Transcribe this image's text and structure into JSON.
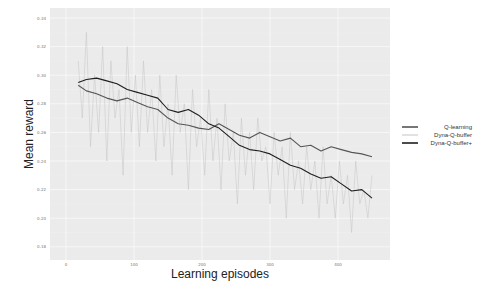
{
  "chart_data": {
    "type": "line",
    "title": "",
    "xlabel": "Learning episodes",
    "ylabel": "Mean reward",
    "xlim": [
      -5,
      475
    ],
    "ylim": [
      0.175,
      0.345
    ],
    "x_ticks": [
      0,
      100,
      200,
      300,
      400
    ],
    "x_tick_labels": [
      "0",
      "100",
      "200",
      "300",
      "400"
    ],
    "y_ticks": [
      0.18,
      0.2,
      0.22,
      0.24,
      0.26,
      0.28,
      0.3,
      0.32,
      0.34
    ],
    "y_tick_labels": [
      "0.18",
      "0.20",
      "0.22",
      "0.24",
      "0.26",
      "0.28",
      "0.30",
      "0.32",
      "0.34"
    ],
    "grid": true,
    "background": "#ebebeb",
    "legend_position": "right",
    "series": [
      {
        "name": "Q-learning",
        "color": "#555555",
        "width": 1.1,
        "x": [
          18,
          30,
          45,
          60,
          75,
          90,
          105,
          120,
          135,
          150,
          165,
          180,
          195,
          210,
          225,
          240,
          255,
          270,
          285,
          300,
          315,
          330,
          345,
          360,
          375,
          390,
          405,
          420,
          435,
          450
        ],
        "values": [
          0.293,
          0.289,
          0.287,
          0.284,
          0.282,
          0.284,
          0.281,
          0.278,
          0.276,
          0.27,
          0.266,
          0.265,
          0.263,
          0.262,
          0.266,
          0.262,
          0.258,
          0.256,
          0.26,
          0.257,
          0.254,
          0.256,
          0.25,
          0.251,
          0.247,
          0.25,
          0.248,
          0.246,
          0.245,
          0.243
        ]
      },
      {
        "name": "Dyna-Q-buffer",
        "color": "#c4c4c4",
        "width": 0.5,
        "x": [
          18,
          24,
          30,
          36,
          42,
          48,
          54,
          60,
          66,
          72,
          78,
          84,
          90,
          96,
          102,
          108,
          114,
          120,
          126,
          132,
          138,
          144,
          150,
          156,
          162,
          168,
          174,
          180,
          186,
          192,
          198,
          204,
          210,
          216,
          222,
          228,
          234,
          240,
          246,
          252,
          258,
          264,
          270,
          276,
          282,
          288,
          294,
          300,
          306,
          312,
          318,
          324,
          330,
          336,
          342,
          348,
          354,
          360,
          366,
          372,
          378,
          384,
          390,
          396,
          402,
          408,
          414,
          420,
          426,
          432,
          438,
          444,
          450
        ],
        "values": [
          0.31,
          0.27,
          0.33,
          0.25,
          0.3,
          0.26,
          0.32,
          0.24,
          0.31,
          0.27,
          0.29,
          0.23,
          0.32,
          0.26,
          0.3,
          0.25,
          0.31,
          0.26,
          0.29,
          0.24,
          0.3,
          0.25,
          0.28,
          0.23,
          0.3,
          0.26,
          0.28,
          0.22,
          0.29,
          0.25,
          0.27,
          0.23,
          0.29,
          0.24,
          0.27,
          0.22,
          0.28,
          0.24,
          0.26,
          0.21,
          0.27,
          0.23,
          0.26,
          0.22,
          0.27,
          0.24,
          0.25,
          0.21,
          0.26,
          0.23,
          0.25,
          0.2,
          0.26,
          0.22,
          0.24,
          0.21,
          0.25,
          0.22,
          0.24,
          0.2,
          0.25,
          0.21,
          0.23,
          0.2,
          0.24,
          0.21,
          0.23,
          0.19,
          0.24,
          0.21,
          0.22,
          0.2,
          0.23
        ]
      },
      {
        "name": "Dyna-Q-buffer+",
        "color": "#1e1e1e",
        "width": 1.1,
        "x": [
          18,
          30,
          45,
          60,
          75,
          90,
          105,
          120,
          135,
          150,
          165,
          180,
          195,
          210,
          225,
          240,
          255,
          270,
          285,
          300,
          315,
          330,
          345,
          360,
          375,
          390,
          405,
          420,
          435,
          450
        ],
        "values": [
          0.295,
          0.297,
          0.298,
          0.296,
          0.294,
          0.29,
          0.288,
          0.286,
          0.284,
          0.276,
          0.274,
          0.276,
          0.272,
          0.266,
          0.263,
          0.257,
          0.251,
          0.248,
          0.247,
          0.245,
          0.241,
          0.237,
          0.235,
          0.231,
          0.228,
          0.229,
          0.224,
          0.219,
          0.22,
          0.214
        ]
      }
    ]
  },
  "legend": {
    "items": [
      {
        "label": "Q-learning",
        "color": "#555555"
      },
      {
        "label": "Dyna-Q-buffer",
        "color": "#c4c4c4"
      },
      {
        "label": "Dyna-Q-buffer+",
        "color": "#1e1e1e"
      }
    ]
  },
  "axes": {
    "xlabel": "Learning episodes",
    "ylabel": "Mean reward"
  }
}
